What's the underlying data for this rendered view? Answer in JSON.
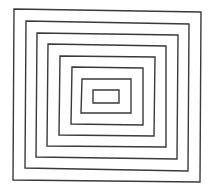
{
  "figure": {
    "stroke_color": "#3a3a3a",
    "background": "#ffffff",
    "rectangles": [
      {
        "name": "rect-1-outermost",
        "points": [
          [
            14,
            9
          ],
          [
            201,
            12
          ],
          [
            200,
            182
          ],
          [
            13,
            180
          ]
        ]
      },
      {
        "name": "rect-2",
        "points": [
          [
            26,
            21
          ],
          [
            189,
            24
          ],
          [
            188,
            171
          ],
          [
            25,
            168
          ]
        ]
      },
      {
        "name": "rect-3",
        "points": [
          [
            37,
            33
          ],
          [
            178,
            35
          ],
          [
            177,
            159
          ],
          [
            36,
            157
          ]
        ]
      },
      {
        "name": "rect-4",
        "points": [
          [
            48,
            44
          ],
          [
            166,
            46
          ],
          [
            166,
            147
          ],
          [
            47,
            146
          ]
        ]
      },
      {
        "name": "rect-5",
        "points": [
          [
            60,
            56
          ],
          [
            155,
            57
          ],
          [
            154,
            136
          ],
          [
            59,
            135
          ]
        ]
      },
      {
        "name": "rect-6",
        "points": [
          [
            72,
            67
          ],
          [
            143,
            68
          ],
          [
            143,
            125
          ],
          [
            71,
            124
          ]
        ]
      },
      {
        "name": "rect-7",
        "points": [
          [
            82,
            79
          ],
          [
            131,
            79
          ],
          [
            131,
            113
          ],
          [
            81,
            113
          ]
        ]
      },
      {
        "name": "rect-8-innermost",
        "points": [
          [
            93,
            90
          ],
          [
            119,
            90
          ],
          [
            119,
            103
          ],
          [
            93,
            103
          ]
        ]
      }
    ]
  }
}
